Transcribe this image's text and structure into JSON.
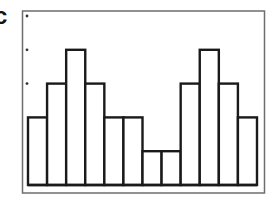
{
  "panel": {
    "label": "c"
  },
  "colors": {
    "bar_stroke": "#1a1a1a",
    "frame_stroke": "#6e6e6e",
    "dot": "#333333",
    "bar_fill": "#ffffff"
  },
  "chart_data": {
    "type": "bar",
    "title": "",
    "xlabel": "",
    "ylabel": "",
    "categories": [
      "1",
      "2",
      "3",
      "4",
      "5",
      "6",
      "7",
      "8",
      "9",
      "10",
      "11",
      "12"
    ],
    "values": [
      2,
      3,
      4,
      3,
      2,
      2,
      1,
      1,
      3,
      4,
      3,
      2
    ],
    "ylim": [
      0,
      5
    ],
    "y_tick_marks": [
      3,
      4,
      5
    ],
    "tick_labels_shown": false,
    "grid": false,
    "legend": null
  }
}
